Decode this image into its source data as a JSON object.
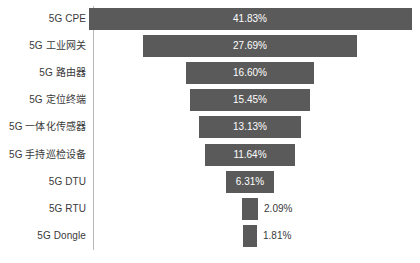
{
  "chart_data": {
    "type": "bar",
    "subtype": "funnel",
    "title": "",
    "xlabel": "",
    "ylabel": "",
    "orientation": "horizontal-centered",
    "grid": false,
    "legend": null,
    "value_suffix": "%",
    "xlim": [
      0,
      41.83
    ],
    "categories": [
      "5G CPE",
      "5G 工业网关",
      "5G 路由器",
      "5G 定位终端",
      "5G 一体化传感器",
      "5G 手持巡检设备",
      "5G DTU",
      "5G RTU",
      "5G Dongle"
    ],
    "values": [
      41.83,
      27.69,
      16.6,
      15.45,
      13.13,
      11.64,
      6.31,
      2.09,
      1.81
    ],
    "labels": [
      "41.83%",
      "27.69%",
      "16.60%",
      "15.45%",
      "13.13%",
      "11.64%",
      "6.31%",
      "2.09%",
      "1.81%"
    ],
    "label_placement": [
      "inside",
      "inside",
      "inside",
      "inside",
      "inside",
      "inside",
      "inside",
      "outside",
      "outside"
    ],
    "bar_color": "#5a5a5a",
    "inside_label_color": "#ffffff",
    "outside_label_color": "#3a3a3a",
    "axis_color": "#b8b8b8",
    "background": "#ffffff"
  },
  "rows": [
    {
      "label": "5G CPE",
      "value_text": "41.83%"
    },
    {
      "label": "5G 工业网关",
      "value_text": "27.69%"
    },
    {
      "label": "5G 路由器",
      "value_text": "16.60%"
    },
    {
      "label": "5G 定位终端",
      "value_text": "15.45%"
    },
    {
      "label": "5G 一体化传感器",
      "value_text": "13.13%"
    },
    {
      "label": "5G 手持巡检设备",
      "value_text": "11.64%"
    },
    {
      "label": "5G DTU",
      "value_text": "6.31%"
    },
    {
      "label": "5G RTU",
      "value_text": "2.09%"
    },
    {
      "label": "5G Dongle",
      "value_text": "1.81%"
    }
  ]
}
